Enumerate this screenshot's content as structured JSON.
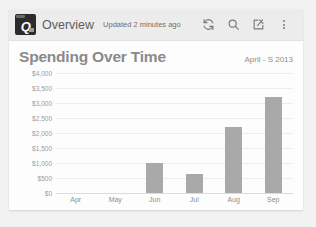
{
  "app": {
    "logo_letter": "Q",
    "logo_icon": "quicken-logo-icon",
    "title": "Overview",
    "updated_text": "Updated 2 minutes ago"
  },
  "header_actions": [
    {
      "name": "sync-icon",
      "label": "Sync"
    },
    {
      "name": "search-icon",
      "label": "Search"
    },
    {
      "name": "compose-icon",
      "label": "Compose"
    },
    {
      "name": "overflow-menu-icon",
      "label": "More options"
    }
  ],
  "card": {
    "title": "Spending Over Time",
    "date_range": "April - S 2013"
  },
  "colors": {
    "bar": "#a9a9a9",
    "header_bg": "#ececec",
    "card_bg": "#fdfdfd",
    "page_bg": "#f2f2f2",
    "gridline": "#ededed",
    "title_text": "#8a8a8a"
  },
  "chart_data": {
    "type": "bar",
    "title": "Spending Over Time",
    "subtitle": "April - S 2013",
    "xlabel": "",
    "ylabel": "",
    "categories": [
      "Apr",
      "May",
      "Jun",
      "Jul",
      "Aug",
      "Sep"
    ],
    "values": [
      0,
      0,
      1000,
      650,
      2200,
      3200
    ],
    "ylim": [
      0,
      4000
    ],
    "ytick_values": [
      4000,
      3500,
      3000,
      2500,
      2000,
      1500,
      1000,
      500,
      0
    ],
    "ytick_labels": [
      "$4,000",
      "$3,500",
      "$3,000",
      "$2,500",
      "$2,000",
      "$1,500",
      "$1,000",
      "$500",
      "$0"
    ],
    "grid": true,
    "legend": false
  }
}
